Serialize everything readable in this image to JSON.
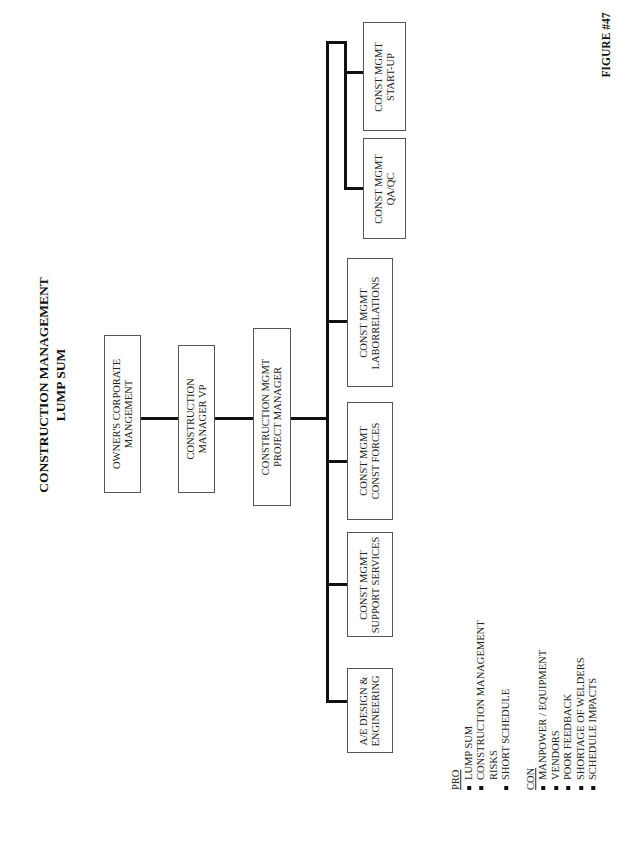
{
  "title": {
    "line1": "CONSTRUCTION MANAGEMENT",
    "line2": "LUMP SUM"
  },
  "figure_label": "FIGURE #47",
  "org_chart": {
    "owner": {
      "line1": "OWNER'S CORPORATE",
      "line2": "MANGEMENT"
    },
    "cm_vp": {
      "line1": "CONSTRUCTION",
      "line2": "MANAGER VP"
    },
    "project_manager": {
      "line1": "CONSTRUCTION MGMT",
      "line2": "PROJECT MANAGER"
    },
    "departments": [
      {
        "line1": "A/E DESIGN &",
        "line2": "ENGINEERING"
      },
      {
        "line1": "CONST MGMT",
        "line2": "SUPPORT SERVICES"
      },
      {
        "line1": "CONST MGMT",
        "line2": "CONST FORCES"
      },
      {
        "line1": "CONST MGMT",
        "line2": "LABORRELATIONS"
      },
      {
        "line1": "CONST MGMT",
        "line2": "QA/QC"
      },
      {
        "line1": "CONST MGMT",
        "line2": "START-UP"
      }
    ]
  },
  "pro": {
    "header": "PRO",
    "items": [
      {
        "text": "LUMP SUM",
        "bullet": true
      },
      {
        "text": "CONSTRUCTION MANAGEMENT",
        "bullet": true
      },
      {
        "text": "RISKS",
        "bullet": false
      },
      {
        "text": "SHORT SCHEDULE",
        "bullet": true
      }
    ]
  },
  "con": {
    "header": "CON",
    "items": [
      {
        "text": "MANPOWER / EQUIPMENT",
        "bullet": true
      },
      {
        "text": "VENDORS",
        "bullet": true
      },
      {
        "text": "POOR FEEDBACK",
        "bullet": true
      },
      {
        "text": "SHORTAGE OF WELDERS",
        "bullet": true
      },
      {
        "text": "SCHEDULE IMPACTS",
        "bullet": true
      }
    ]
  }
}
